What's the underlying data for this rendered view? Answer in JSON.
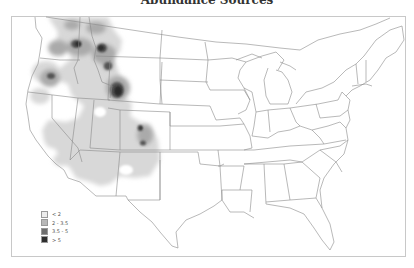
{
  "title": "Abundance Sources",
  "legend": {
    "items": [
      {
        "label": "< 2",
        "color": "#ececec"
      },
      {
        "label": "2 - 3.5",
        "color": "#b8b8b8"
      },
      {
        "label": "3.5 - 5",
        "color": "#6e6e6e"
      },
      {
        "label": "> 5",
        "color": "#2e2e2e"
      }
    ]
  },
  "colors": {
    "state_lines": "#8a8a8a",
    "frame": "#c8c8c8",
    "light_fill": "#d6d6d6",
    "mid_fill": "#a8a8a8",
    "dark_fill": "#555555",
    "darkest_fill": "#2a2a2a"
  }
}
